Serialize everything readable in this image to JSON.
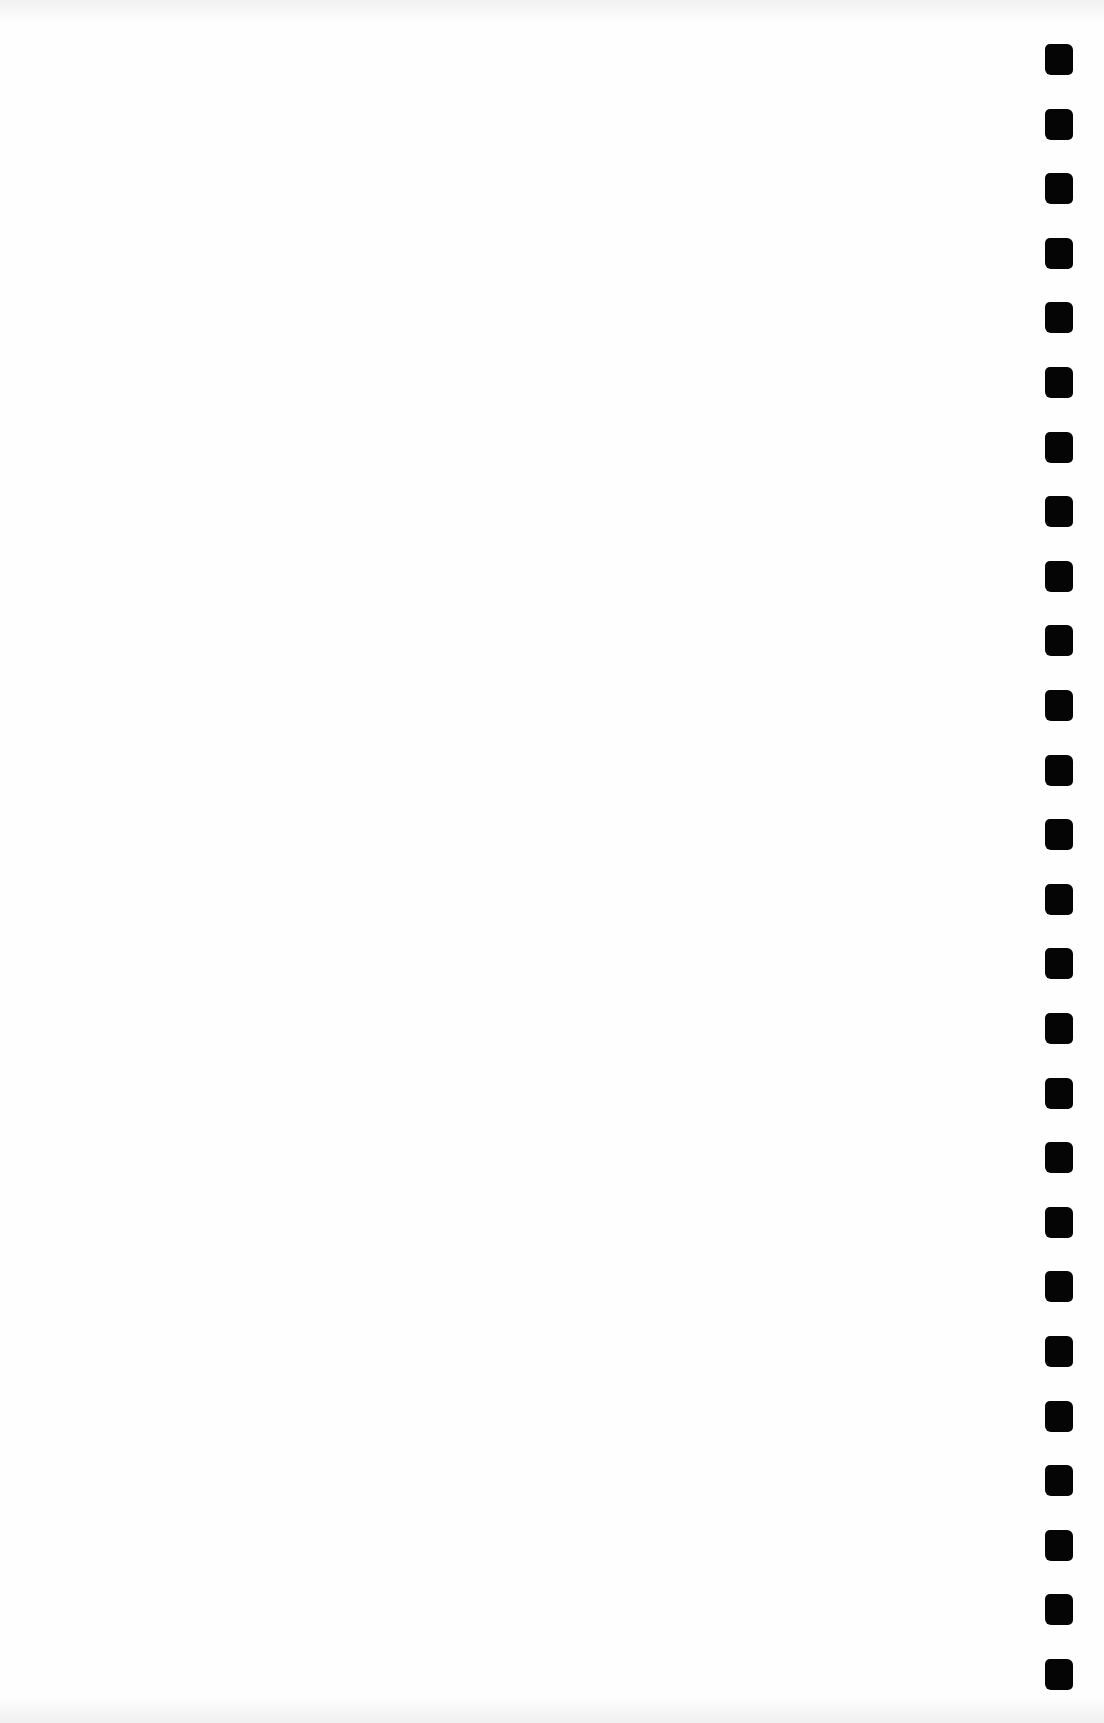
{
  "document": {
    "type": "blank scanned page",
    "text_content": "",
    "background_color": "#fefefe",
    "binding": {
      "type": "spiral-binding-holes",
      "side": "right",
      "hole_count": 26,
      "hole_color": "#050505",
      "first_hole_top_px": 44,
      "hole_spacing_px": 64.6
    }
  }
}
